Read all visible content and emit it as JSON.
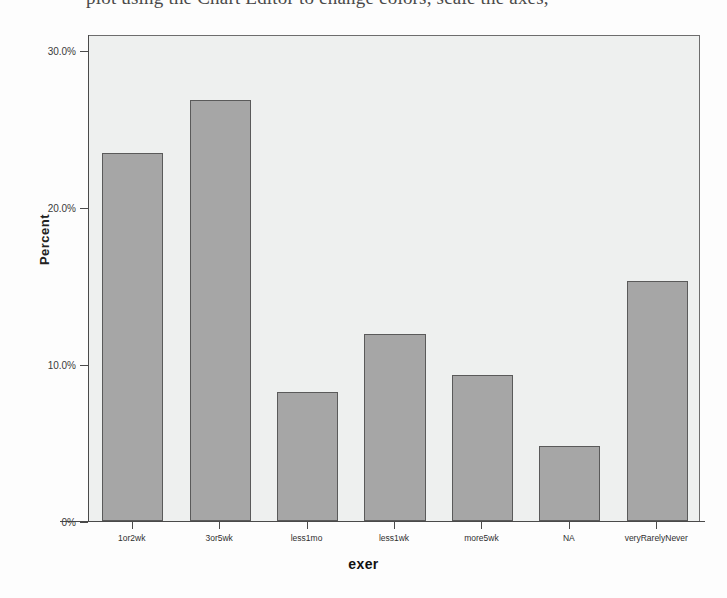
{
  "caption": {
    "text": "plot using the Chart Editor to change colors, scale the axes,"
  },
  "chart_data": {
    "type": "bar",
    "title": "",
    "xlabel": "exer",
    "ylabel": "Percent",
    "categories": [
      "1or2wk",
      "3or5wk",
      "less1mo",
      "less1wk",
      "more5wk",
      "NA",
      "veryRarelyNever"
    ],
    "values": [
      23.4,
      26.8,
      8.2,
      11.9,
      9.3,
      4.8,
      15.3
    ],
    "ylim": [
      0,
      31.0
    ],
    "ytick_values": [
      0,
      10,
      20,
      30
    ],
    "ytick_labels": [
      "0%",
      "10.0%",
      "20.0%",
      "30.0%"
    ],
    "grid": false,
    "legend": null,
    "bar_color": "#a6a6a6",
    "bar_border_color": "#5a5a5a",
    "plot_background": "#eef0ef"
  }
}
